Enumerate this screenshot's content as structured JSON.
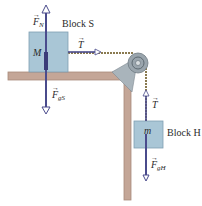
{
  "diagram": {
    "type": "physics-free-body",
    "colors": {
      "block_fill": "#a9c6d6",
      "block_stroke": "#7f9fb2",
      "table": "#c4a697",
      "table_edge": "#a98a7b",
      "arrow": "#4a4b8c",
      "rope": "#8a7a50",
      "pulley": "#9aa5ad"
    },
    "block_s": {
      "name": "Block S",
      "mass_label": "M",
      "forces": {
        "normal": {
          "symbol": "F",
          "sub": "N"
        },
        "gravity": {
          "symbol": "F",
          "sub": "gS"
        },
        "tension": {
          "symbol": "T",
          "sub": ""
        }
      }
    },
    "block_h": {
      "name": "Block H",
      "mass_label": "m",
      "forces": {
        "tension": {
          "symbol": "T",
          "sub": ""
        },
        "gravity": {
          "symbol": "F",
          "sub": "gH"
        }
      }
    },
    "vector_arrow": "→"
  }
}
